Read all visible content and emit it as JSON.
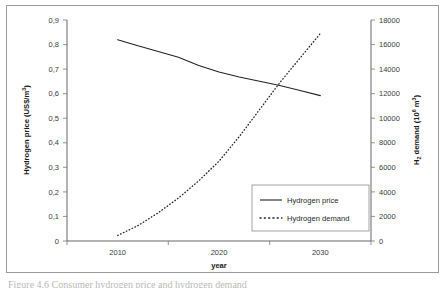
{
  "figure": {
    "caption_fragment": "Figure 4.6  Consumer hydrogen price and hydrogen demand"
  },
  "chart_data": {
    "type": "line",
    "title": "",
    "xlabel": "year",
    "ylabel": "Hydrogen price (US$/m",
    "ylabel_sup": "3",
    "ylabel_tail": ")",
    "y2label_head": "H",
    "y2label_sub": "2",
    "y2label_mid": " demand (10",
    "y2label_sup": "6",
    "y2label_tail": " m",
    "y2label_sup2": "3",
    "y2label_end": ")",
    "xlim": [
      2005,
      2035
    ],
    "ylim": [
      0,
      0.9
    ],
    "y2lim": [
      0,
      18000
    ],
    "grid": false,
    "legend_position": "lower-right",
    "x_tick_labels": [
      "2010",
      "2020",
      "2030"
    ],
    "x_tick_values": [
      2010,
      2020,
      2030
    ],
    "y_tick_labels": [
      "0",
      "0,1",
      "0,2",
      "0,3",
      "0,4",
      "0,5",
      "0,6",
      "0,7",
      "0,8",
      "0,9"
    ],
    "y_tick_values": [
      0,
      0.1,
      0.2,
      0.3,
      0.4,
      0.5,
      0.6,
      0.7,
      0.8,
      0.9
    ],
    "y2_tick_labels": [
      "0",
      "2000",
      "4000",
      "6000",
      "8000",
      "10000",
      "12000",
      "14000",
      "16000",
      "18000"
    ],
    "y2_tick_values": [
      0,
      2000,
      4000,
      6000,
      8000,
      10000,
      12000,
      14000,
      16000,
      18000
    ],
    "series": [
      {
        "name": "Hydrogen price",
        "axis": "left",
        "style": "solid",
        "color": "#222222",
        "x": [
          2010,
          2012,
          2014,
          2016,
          2018,
          2020,
          2022,
          2024,
          2026,
          2028,
          2030
        ],
        "values": [
          0.82,
          0.795,
          0.772,
          0.748,
          0.715,
          0.688,
          0.668,
          0.651,
          0.633,
          0.613,
          0.592
        ]
      },
      {
        "name": "Hydrogen demand",
        "axis": "right",
        "style": "dotted",
        "color": "#222222",
        "x": [
          2010,
          2012,
          2014,
          2016,
          2018,
          2020,
          2022,
          2024,
          2026,
          2028,
          2030
        ],
        "values": [
          450,
          1250,
          2300,
          3500,
          4900,
          6500,
          8500,
          10700,
          12900,
          14900,
          16900
        ]
      }
    ],
    "legend": [
      {
        "label": "Hydrogen price",
        "style": "solid"
      },
      {
        "label": "Hydrogen demand",
        "style": "dotted"
      }
    ]
  }
}
